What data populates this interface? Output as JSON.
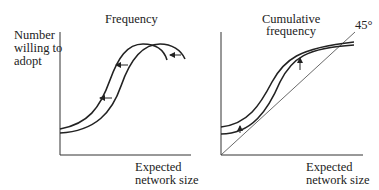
{
  "left_panel": {
    "title": "Frequency",
    "y_label_lines": [
      "Number",
      "willing to",
      "adopt"
    ],
    "x_label_lines": [
      "Expected",
      "network size"
    ],
    "curves": [
      "original frequency distribution",
      "shifted frequency distribution (left)"
    ],
    "arrows": [
      "left",
      "left",
      "left"
    ]
  },
  "right_panel": {
    "title_lines": [
      "Cumulative",
      "frequency"
    ],
    "angle_label": "45°",
    "x_label_lines": [
      "Expected",
      "network size"
    ],
    "curves": [
      "original cumulative curve",
      "shifted cumulative curve (up)"
    ],
    "arrows": [
      "up",
      "up"
    ]
  },
  "colors": {
    "line": "#222222",
    "background": "#ffffff"
  }
}
